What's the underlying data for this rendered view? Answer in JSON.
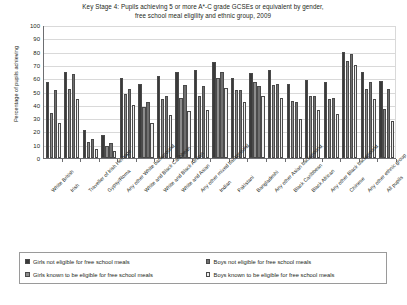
{
  "chart_data": {
    "type": "bar",
    "title": "Key Stage 4: Pupils achieving 5 or more A*-C grade GCSEs or equivalent by gender, free school meal eligility and ethnic group, 2009",
    "title_line1": "Key Stage 4: Pupils achieving 5 or more A*-C grade GCSEs or equivalent by gender,",
    "title_line2": "free school meal eligility and ethnic group, 2009",
    "xlabel": "",
    "ylabel": "Percentage of pupils achieving",
    "ylim": [
      0,
      100
    ],
    "ytick_values": [
      0,
      10,
      20,
      30,
      40,
      50,
      60,
      70,
      80,
      90,
      100
    ],
    "grid": true,
    "legend_position": "bottom",
    "categories": [
      "White British",
      "Irish",
      "Traveller of Irish Heritage",
      "Gypsy/Roma",
      "Any other White background",
      "White and Black Caribbean",
      "White and Black African",
      "White and Asian",
      "Any other mixed background",
      "Indian",
      "Pakistani",
      "Bangladeshi",
      "Any other Asian background",
      "Black Caribbean",
      "Black African",
      "Any other Black background",
      "Chinese",
      "Any other ethnic group",
      "All pupils"
    ],
    "series": [
      {
        "name": "Girls not eligible for free school meals",
        "key": "girls_not_eligible",
        "values": [
          57,
          65,
          21,
          17,
          60,
          56,
          62,
          65,
          66,
          72,
          60,
          64,
          66,
          56,
          59,
          57,
          80,
          65,
          58
        ]
      },
      {
        "name": "Girls known to be eligible for free school meals",
        "key": "girls_eligible",
        "values": [
          34,
          52,
          12,
          9,
          48,
          38,
          44,
          45,
          47,
          60,
          51,
          57,
          55,
          43,
          47,
          44,
          73,
          52,
          37
        ]
      },
      {
        "name": "Boys not eligible for free school meals",
        "key": "boys_not_eligible",
        "values": [
          51,
          63,
          14,
          11,
          52,
          42,
          47,
          55,
          54,
          65,
          51,
          54,
          56,
          42,
          47,
          45,
          78,
          57,
          52
        ]
      },
      {
        "name": "Boys known to be eligible for free school meals",
        "key": "boys_eligible",
        "values": [
          26,
          44,
          7,
          5,
          40,
          26,
          32,
          35,
          36,
          53,
          42,
          47,
          45,
          29,
          36,
          33,
          70,
          44,
          28
        ]
      }
    ]
  },
  "legend": {
    "items": [
      {
        "label": "Girls not eligible for free school meals",
        "swatch": "dark-solid"
      },
      {
        "label": "Boys not eligible for free school meals",
        "swatch": "hatched"
      },
      {
        "label": "Girls known to be eligible for free school meals",
        "swatch": "mid-grey"
      },
      {
        "label": "Boys known to be eligible for free school meals",
        "swatch": "light"
      }
    ]
  }
}
